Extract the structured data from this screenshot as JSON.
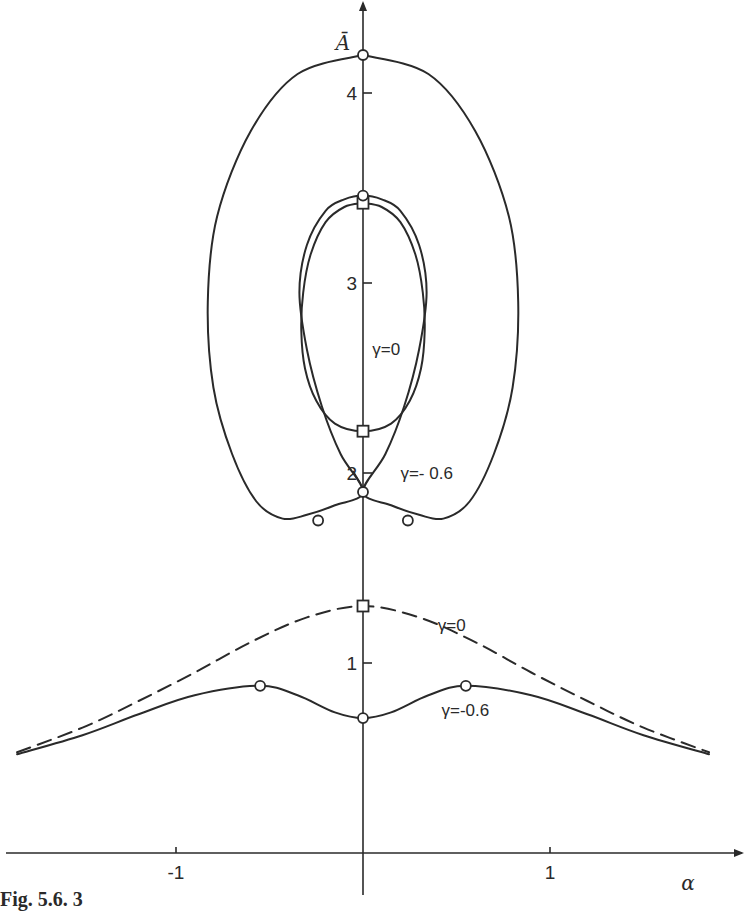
{
  "caption": "Fig. 5.6. 3",
  "chart_data": {
    "type": "line",
    "title": "",
    "xlabel": "α",
    "ylabel": "Ā",
    "xlim": [
      -1.95,
      2.05
    ],
    "ylim": [
      0,
      4.5
    ],
    "x_ticks": [
      -1,
      1
    ],
    "x_tick_labels": [
      "-1",
      "1"
    ],
    "y_ticks": [
      1,
      2,
      3,
      4
    ],
    "y_tick_labels": [
      "1",
      "2",
      "3",
      "4"
    ],
    "grid": false,
    "legend": "none (inline curve labels)",
    "series": [
      {
        "name": "γ=0 (closed loop)",
        "style": "solid",
        "label": "γ=0",
        "points": [
          [
            0,
            3.42
          ],
          [
            0.1,
            3.4
          ],
          [
            0.2,
            3.32
          ],
          [
            0.28,
            3.15
          ],
          [
            0.32,
            2.95
          ],
          [
            0.33,
            2.75
          ],
          [
            0.31,
            2.55
          ],
          [
            0.25,
            2.38
          ],
          [
            0.15,
            2.26
          ],
          [
            0,
            2.22
          ],
          [
            -0.15,
            2.26
          ],
          [
            -0.25,
            2.38
          ],
          [
            -0.31,
            2.55
          ],
          [
            -0.33,
            2.75
          ],
          [
            -0.32,
            2.95
          ],
          [
            -0.28,
            3.15
          ],
          [
            -0.2,
            3.32
          ],
          [
            -0.1,
            3.4
          ],
          [
            0,
            3.42
          ]
        ],
        "markers": [
          {
            "shape": "square",
            "x": 0,
            "y": 3.42
          },
          {
            "shape": "square",
            "x": 0,
            "y": 2.22
          }
        ]
      },
      {
        "name": "γ=-0.6 (loop family)",
        "style": "solid",
        "label": "γ=- 0.6",
        "points": [
          [
            0,
            4.2
          ],
          [
            0.35,
            4.1
          ],
          [
            0.6,
            3.8
          ],
          [
            0.78,
            3.35
          ],
          [
            0.83,
            2.9
          ],
          [
            0.8,
            2.45
          ],
          [
            0.7,
            2.1
          ],
          [
            0.57,
            1.85
          ],
          [
            0.43,
            1.76
          ],
          [
            0.3,
            1.78
          ],
          [
            0.15,
            1.83
          ],
          [
            0,
            1.9
          ],
          [
            0.12,
            2.1
          ],
          [
            0.22,
            2.35
          ],
          [
            0.3,
            2.65
          ],
          [
            0.34,
            2.95
          ],
          [
            0.3,
            3.2
          ],
          [
            0.2,
            3.38
          ],
          [
            0.1,
            3.44
          ],
          [
            0,
            3.46
          ],
          [
            -0.1,
            3.44
          ],
          [
            -0.2,
            3.38
          ],
          [
            -0.3,
            3.2
          ],
          [
            -0.34,
            2.95
          ],
          [
            -0.3,
            2.65
          ],
          [
            -0.22,
            2.35
          ],
          [
            -0.12,
            2.1
          ],
          [
            0,
            1.9
          ],
          [
            -0.15,
            1.83
          ],
          [
            -0.3,
            1.78
          ],
          [
            -0.43,
            1.76
          ],
          [
            -0.57,
            1.85
          ],
          [
            -0.7,
            2.1
          ],
          [
            -0.8,
            2.45
          ],
          [
            -0.83,
            2.9
          ],
          [
            -0.78,
            3.35
          ],
          [
            -0.6,
            3.8
          ],
          [
            -0.35,
            4.1
          ],
          [
            0,
            4.2
          ]
        ],
        "markers": [
          {
            "shape": "circle",
            "x": 0,
            "y": 4.2
          },
          {
            "shape": "circle",
            "x": 0,
            "y": 3.46
          },
          {
            "shape": "circle",
            "x": 0,
            "y": 1.9
          },
          {
            "shape": "circle",
            "x": -0.24,
            "y": 1.75
          },
          {
            "shape": "circle",
            "x": 0.24,
            "y": 1.75
          }
        ]
      },
      {
        "name": "γ=0 (lower branch)",
        "style": "dashed",
        "label": "γ=0",
        "points": [
          [
            -1.85,
            0.53
          ],
          [
            -1.5,
            0.66
          ],
          [
            -1.2,
            0.8
          ],
          [
            -0.9,
            0.95
          ],
          [
            -0.6,
            1.11
          ],
          [
            -0.3,
            1.24
          ],
          [
            0,
            1.3
          ],
          [
            0.3,
            1.24
          ],
          [
            0.6,
            1.11
          ],
          [
            0.9,
            0.95
          ],
          [
            1.2,
            0.8
          ],
          [
            1.5,
            0.66
          ],
          [
            1.85,
            0.53
          ]
        ],
        "markers": [
          {
            "shape": "square",
            "x": 0,
            "y": 1.3
          }
        ]
      },
      {
        "name": "γ=-0.6 (lower branch)",
        "style": "solid",
        "label": "γ=-0.6",
        "points": [
          [
            -1.85,
            0.52
          ],
          [
            -1.5,
            0.62
          ],
          [
            -1.2,
            0.73
          ],
          [
            -0.9,
            0.83
          ],
          [
            -0.55,
            0.88
          ],
          [
            -0.35,
            0.83
          ],
          [
            -0.15,
            0.74
          ],
          [
            0,
            0.71
          ],
          [
            0.15,
            0.74
          ],
          [
            0.35,
            0.83
          ],
          [
            0.55,
            0.88
          ],
          [
            0.9,
            0.83
          ],
          [
            1.2,
            0.73
          ],
          [
            1.5,
            0.62
          ],
          [
            1.85,
            0.52
          ]
        ],
        "markers": [
          {
            "shape": "circle",
            "x": -0.55,
            "y": 0.88
          },
          {
            "shape": "circle",
            "x": 0,
            "y": 0.71
          },
          {
            "shape": "circle",
            "x": 0.55,
            "y": 0.88
          }
        ]
      }
    ],
    "annotations": [
      {
        "text": "γ=0",
        "near": [
          0.05,
          2.62
        ]
      },
      {
        "text": "γ=- 0.6",
        "near": [
          0.2,
          1.97
        ]
      },
      {
        "text": "γ=0",
        "near": [
          0.4,
          1.17
        ]
      },
      {
        "text": "γ=-0.6",
        "near": [
          0.42,
          0.72
        ]
      }
    ]
  }
}
